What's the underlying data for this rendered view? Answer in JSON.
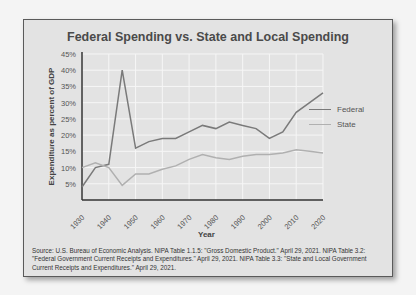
{
  "chart_data": {
    "type": "line",
    "title": "Federal Spending vs. State and Local Spending",
    "xlabel": "Year",
    "ylabel": "Expenditure as percent of GDP",
    "x": [
      1930,
      1935,
      1940,
      1945,
      1950,
      1955,
      1960,
      1965,
      1970,
      1975,
      1980,
      1985,
      1990,
      1995,
      2000,
      2005,
      2010,
      2015,
      2020
    ],
    "series": [
      {
        "name": "Federal",
        "color": "#7a7a7a",
        "values": [
          4,
          10,
          11,
          40,
          16,
          18,
          19,
          19,
          21,
          23,
          22,
          24,
          23,
          22,
          19,
          21,
          27,
          30,
          33
        ]
      },
      {
        "name": "State",
        "color": "#b0b0b0",
        "values": [
          10,
          11.5,
          10,
          4.5,
          8,
          8,
          9.5,
          10.5,
          12.5,
          14,
          13,
          12.5,
          13.5,
          14,
          14,
          14.5,
          15.5,
          15,
          14.5
        ]
      }
    ],
    "x_ticks": [
      "1930",
      "1940",
      "1950",
      "1960",
      "1970",
      "1980",
      "1990",
      "2000",
      "2010",
      "2020"
    ],
    "y_ticks": [
      "5%",
      "10%",
      "15%",
      "20%",
      "25%",
      "30%",
      "35%",
      "40%",
      "45%"
    ],
    "xlim": [
      1930,
      2020
    ],
    "ylim": [
      0,
      45
    ],
    "grid": true,
    "legend_position": "right"
  },
  "source_note": "Source: U.S. Bureau of Economic Analysis. NIPA Table 1.1.5: \"Gross Domestic Product.\" April 29, 2021. NIPA Table 3.2: \"Federal Government Current Receipts and Expenditures.\" April 29, 2021. NIPA Table 3.3: \"State and Local Government Current Receipts and Expenditures.\" April 29, 2021."
}
